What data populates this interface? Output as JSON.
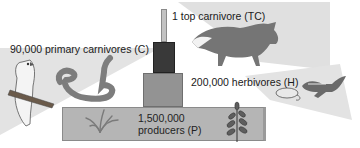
{
  "diagram": {
    "type": "ecological pyramid of numbers",
    "levels": [
      {
        "key": "TC",
        "count": "1",
        "label": "1 top carnivore (TC)",
        "organisms": [
          "fox"
        ],
        "color": "#b9b9b9"
      },
      {
        "key": "C",
        "count": "90,000",
        "label": "90,000 primary carnivores (C)",
        "organisms": [
          "owl",
          "snake"
        ],
        "color": "#3a3a3a"
      },
      {
        "key": "H",
        "count": "200,000",
        "label": "200,000 herbivores (H)",
        "organisms": [
          "mouse",
          "chipmunk"
        ],
        "color": "#8f8f8f"
      },
      {
        "key": "P",
        "count": "1,500,000",
        "label_line1": "1,500,000",
        "label_line2": "producers (P)",
        "organisms": [
          "grass",
          "leafy plant"
        ],
        "color": "#b3b3b3"
      }
    ]
  },
  "colors": {
    "beam": "#dedede",
    "top_bar": "#b9b9b9",
    "carnivore_box": "#3a3a3a",
    "herbivore_box": "#8f8f8f",
    "producer_box": "#b3b3b3",
    "animal": "#6e6e6e"
  }
}
